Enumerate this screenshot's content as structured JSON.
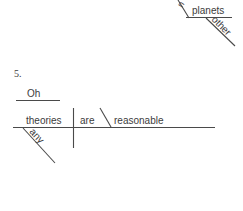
{
  "page": {
    "background_color": "#ffffff",
    "ink_color": "#4a4a4a",
    "text_color": "#3c3c3c",
    "width": 243,
    "height": 211
  },
  "cropped_diagram_above": {
    "note_label": "partial-diagram-top",
    "baseline_word": "planets",
    "modifier_word": "other",
    "cropped_fragment": "n"
  },
  "exercise": {
    "number": "5.",
    "interjection": "Oh",
    "subject": "theories",
    "subject_modifier": "any",
    "verb": "are",
    "predicate_adjective": "reasonable"
  }
}
